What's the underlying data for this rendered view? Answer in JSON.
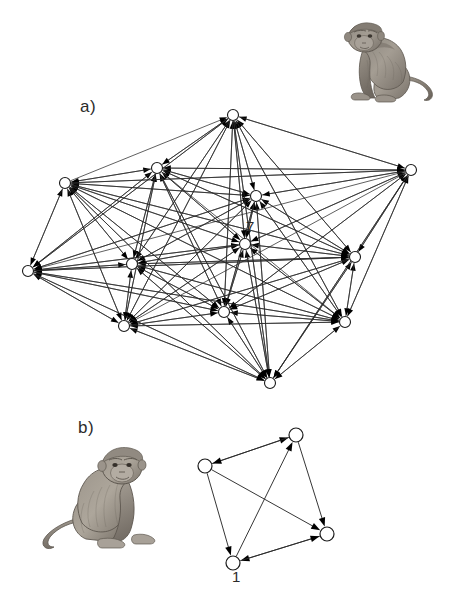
{
  "figure": {
    "panels": [
      {
        "id": "a",
        "label": "a)",
        "label_x": 80,
        "label_y": 97,
        "description": "Large dense directed dominance network with 12 nodes",
        "illustration": "macaque-sitting",
        "node_count": 12
      },
      {
        "id": "b",
        "label": "b)",
        "label_x": 78,
        "label_y": 418,
        "description": "Small sparse directed dominance network with 4 nodes",
        "illustration": "macaque-sitting",
        "node_count": 4
      }
    ]
  },
  "annotations": [
    {
      "name": "node-label-7",
      "text": "7",
      "x": 246,
      "y": 218,
      "panel": "a"
    },
    {
      "name": "node-label-1",
      "text": "1",
      "x": 232,
      "y": 568,
      "panel": "b"
    }
  ],
  "colors": {
    "edge": "#2b2b2b",
    "node_fill": "#ffffff",
    "node_stroke": "#1a1a1a",
    "arrowhead": "#000000",
    "text": "#2b2b2b",
    "background": "#ffffff",
    "illustration_ink": "#6e6a63"
  },
  "graph_a": {
    "type": "directed-network",
    "node_radius": 5.5,
    "nodes": [
      {
        "id": "a1",
        "x": 233,
        "y": 115
      },
      {
        "id": "a2",
        "x": 157,
        "y": 168
      },
      {
        "id": "a3",
        "x": 65,
        "y": 183
      },
      {
        "id": "a4",
        "x": 411,
        "y": 170
      },
      {
        "id": "a5",
        "x": 256,
        "y": 196
      },
      {
        "id": "a6",
        "x": 245,
        "y": 244
      },
      {
        "id": "a7",
        "x": 132,
        "y": 264
      },
      {
        "id": "a8",
        "x": 28,
        "y": 271
      },
      {
        "id": "a9",
        "x": 355,
        "y": 257
      },
      {
        "id": "a10",
        "x": 124,
        "y": 326
      },
      {
        "id": "a11",
        "x": 224,
        "y": 312
      },
      {
        "id": "a12",
        "x": 345,
        "y": 322
      },
      {
        "id": "a13",
        "x": 270,
        "y": 383
      }
    ],
    "edges": [
      [
        "a3",
        "a1"
      ],
      [
        "a4",
        "a1"
      ],
      [
        "a2",
        "a1"
      ],
      [
        "a5",
        "a1"
      ],
      [
        "a6",
        "a1"
      ],
      [
        "a7",
        "a1"
      ],
      [
        "a8",
        "a1"
      ],
      [
        "a10",
        "a1"
      ],
      [
        "a11",
        "a1"
      ],
      [
        "a13",
        "a1"
      ],
      [
        "a9",
        "a1"
      ],
      [
        "a12",
        "a1"
      ],
      [
        "a3",
        "a2"
      ],
      [
        "a1",
        "a2"
      ],
      [
        "a5",
        "a2"
      ],
      [
        "a6",
        "a2"
      ],
      [
        "a7",
        "a2"
      ],
      [
        "a8",
        "a2"
      ],
      [
        "a10",
        "a2"
      ],
      [
        "a11",
        "a2"
      ],
      [
        "a13",
        "a2"
      ],
      [
        "a4",
        "a2"
      ],
      [
        "a9",
        "a2"
      ],
      [
        "a2",
        "a3"
      ],
      [
        "a5",
        "a3"
      ],
      [
        "a6",
        "a3"
      ],
      [
        "a7",
        "a3"
      ],
      [
        "a8",
        "a3"
      ],
      [
        "a10",
        "a3"
      ],
      [
        "a11",
        "a3"
      ],
      [
        "a4",
        "a3"
      ],
      [
        "a9",
        "a3"
      ],
      [
        "a12",
        "a3"
      ],
      [
        "a13",
        "a3"
      ],
      [
        "a1",
        "a4"
      ],
      [
        "a2",
        "a4"
      ],
      [
        "a3",
        "a4"
      ],
      [
        "a5",
        "a4"
      ],
      [
        "a6",
        "a4"
      ],
      [
        "a9",
        "a4"
      ],
      [
        "a12",
        "a4"
      ],
      [
        "a11",
        "a4"
      ],
      [
        "a13",
        "a4"
      ],
      [
        "a1",
        "a5"
      ],
      [
        "a2",
        "a5"
      ],
      [
        "a3",
        "a5"
      ],
      [
        "a4",
        "a5"
      ],
      [
        "a6",
        "a5"
      ],
      [
        "a7",
        "a5"
      ],
      [
        "a8",
        "a5"
      ],
      [
        "a9",
        "a5"
      ],
      [
        "a10",
        "a5"
      ],
      [
        "a11",
        "a5"
      ],
      [
        "a12",
        "a5"
      ],
      [
        "a13",
        "a5"
      ],
      [
        "a1",
        "a6"
      ],
      [
        "a2",
        "a6"
      ],
      [
        "a3",
        "a6"
      ],
      [
        "a4",
        "a6"
      ],
      [
        "a5",
        "a6"
      ],
      [
        "a7",
        "a6"
      ],
      [
        "a8",
        "a6"
      ],
      [
        "a9",
        "a6"
      ],
      [
        "a10",
        "a6"
      ],
      [
        "a11",
        "a6"
      ],
      [
        "a12",
        "a6"
      ],
      [
        "a13",
        "a6"
      ],
      [
        "a2",
        "a7"
      ],
      [
        "a3",
        "a7"
      ],
      [
        "a5",
        "a7"
      ],
      [
        "a6",
        "a7"
      ],
      [
        "a8",
        "a7"
      ],
      [
        "a10",
        "a7"
      ],
      [
        "a11",
        "a7"
      ],
      [
        "a12",
        "a7"
      ],
      [
        "a9",
        "a7"
      ],
      [
        "a13",
        "a7"
      ],
      [
        "a1",
        "a7"
      ],
      [
        "a3",
        "a8"
      ],
      [
        "a2",
        "a8"
      ],
      [
        "a5",
        "a8"
      ],
      [
        "a6",
        "a8"
      ],
      [
        "a7",
        "a8"
      ],
      [
        "a10",
        "a8"
      ],
      [
        "a11",
        "a8"
      ],
      [
        "a9",
        "a8"
      ],
      [
        "a12",
        "a8"
      ],
      [
        "a13",
        "a8"
      ],
      [
        "a4",
        "a8"
      ],
      [
        "a1",
        "a8"
      ],
      [
        "a4",
        "a9"
      ],
      [
        "a5",
        "a9"
      ],
      [
        "a6",
        "a9"
      ],
      [
        "a1",
        "a9"
      ],
      [
        "a2",
        "a9"
      ],
      [
        "a3",
        "a9"
      ],
      [
        "a11",
        "a9"
      ],
      [
        "a12",
        "a9"
      ],
      [
        "a13",
        "a9"
      ],
      [
        "a7",
        "a9"
      ],
      [
        "a10",
        "a9"
      ],
      [
        "a8",
        "a9"
      ],
      [
        "a2",
        "a10"
      ],
      [
        "a3",
        "a10"
      ],
      [
        "a5",
        "a10"
      ],
      [
        "a6",
        "a10"
      ],
      [
        "a7",
        "a10"
      ],
      [
        "a8",
        "a10"
      ],
      [
        "a11",
        "a10"
      ],
      [
        "a12",
        "a10"
      ],
      [
        "a13",
        "a10"
      ],
      [
        "a9",
        "a10"
      ],
      [
        "a1",
        "a10"
      ],
      [
        "a4",
        "a10"
      ],
      [
        "a1",
        "a11"
      ],
      [
        "a2",
        "a11"
      ],
      [
        "a3",
        "a11"
      ],
      [
        "a5",
        "a11"
      ],
      [
        "a6",
        "a11"
      ],
      [
        "a7",
        "a11"
      ],
      [
        "a8",
        "a11"
      ],
      [
        "a9",
        "a11"
      ],
      [
        "a10",
        "a11"
      ],
      [
        "a12",
        "a11"
      ],
      [
        "a13",
        "a11"
      ],
      [
        "a4",
        "a11"
      ],
      [
        "a4",
        "a12"
      ],
      [
        "a5",
        "a12"
      ],
      [
        "a6",
        "a12"
      ],
      [
        "a9",
        "a12"
      ],
      [
        "a11",
        "a12"
      ],
      [
        "a13",
        "a12"
      ],
      [
        "a2",
        "a12"
      ],
      [
        "a3",
        "a12"
      ],
      [
        "a7",
        "a12"
      ],
      [
        "a10",
        "a12"
      ],
      [
        "a1",
        "a12"
      ],
      [
        "a8",
        "a12"
      ],
      [
        "a3",
        "a13"
      ],
      [
        "a5",
        "a13"
      ],
      [
        "a6",
        "a13"
      ],
      [
        "a7",
        "a13"
      ],
      [
        "a8",
        "a13"
      ],
      [
        "a10",
        "a13"
      ],
      [
        "a11",
        "a13"
      ],
      [
        "a12",
        "a13"
      ],
      [
        "a9",
        "a13"
      ],
      [
        "a2",
        "a13"
      ],
      [
        "a1",
        "a13"
      ],
      [
        "a4",
        "a13"
      ]
    ]
  },
  "graph_b": {
    "type": "directed-network",
    "node_radius": 7,
    "nodes": [
      {
        "id": "b1",
        "x": 296,
        "y": 435,
        "label": ""
      },
      {
        "id": "b2",
        "x": 205,
        "y": 466,
        "label": ""
      },
      {
        "id": "b3",
        "x": 327,
        "y": 534,
        "label": ""
      },
      {
        "id": "b4",
        "x": 233,
        "y": 563,
        "label": "1"
      }
    ],
    "edges": [
      [
        "b2",
        "b1"
      ],
      [
        "b1",
        "b2"
      ],
      [
        "b4",
        "b1"
      ],
      [
        "b1",
        "b3"
      ],
      [
        "b2",
        "b3"
      ],
      [
        "b2",
        "b4"
      ],
      [
        "b3",
        "b4"
      ],
      [
        "b4",
        "b3"
      ]
    ]
  }
}
